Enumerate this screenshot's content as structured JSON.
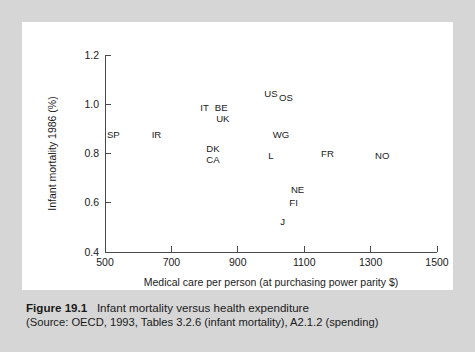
{
  "figure": {
    "background_color": "#d6d6d6",
    "panel_color": "#ffffff",
    "caption_number": "Figure 19.1",
    "caption_title": "Infant mortality versus health expenditure",
    "caption_source": "(Source: OECD, 1993, Tables 3.2.6 (infant mortality), A2.1.2 (spending)"
  },
  "chart_data": {
    "type": "scatter",
    "title": "",
    "xlabel": "Medical care per person (at purchasing power parity $)",
    "ylabel": "Infant mortality 1986 (%)",
    "xlim": [
      500,
      1500
    ],
    "ylim": [
      0.4,
      1.2
    ],
    "xticks": [
      500,
      700,
      900,
      1100,
      1300,
      1500
    ],
    "xtick_labels": [
      "500",
      "700",
      "900",
      "1100",
      "1300",
      "1500"
    ],
    "yticks": [
      0.4,
      0.6,
      0.8,
      1.0,
      1.2
    ],
    "ytick_labels": [
      "0.4",
      "0.6",
      "0.8",
      "1.0",
      "1.2"
    ],
    "grid": false,
    "legend": "none",
    "marker_style": "text-label",
    "points": [
      {
        "label": "SP",
        "x": 525,
        "y": 0.875
      },
      {
        "label": "IR",
        "x": 655,
        "y": 0.875
      },
      {
        "label": "IT",
        "x": 800,
        "y": 0.985
      },
      {
        "label": "BE",
        "x": 850,
        "y": 0.985
      },
      {
        "label": "UK",
        "x": 855,
        "y": 0.94
      },
      {
        "label": "DK",
        "x": 825,
        "y": 0.818
      },
      {
        "label": "CA",
        "x": 825,
        "y": 0.775
      },
      {
        "label": "US",
        "x": 1000,
        "y": 1.045
      },
      {
        "label": "OS",
        "x": 1045,
        "y": 1.025
      },
      {
        "label": "WG",
        "x": 1030,
        "y": 0.875
      },
      {
        "label": "L",
        "x": 1000,
        "y": 0.79
      },
      {
        "label": "FR",
        "x": 1170,
        "y": 0.8
      },
      {
        "label": "NO",
        "x": 1335,
        "y": 0.79
      },
      {
        "label": "NE",
        "x": 1080,
        "y": 0.655
      },
      {
        "label": "FI",
        "x": 1068,
        "y": 0.6
      },
      {
        "label": "J",
        "x": 1035,
        "y": 0.525
      }
    ]
  }
}
